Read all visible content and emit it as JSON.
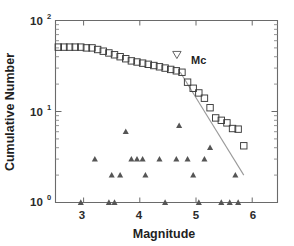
{
  "chart_data": {
    "type": "scatter",
    "title": "",
    "xlabel": "Magnitude",
    "ylabel": "Cumulative Number",
    "xlim": [
      2.5,
      6.45
    ],
    "ylim": [
      1,
      100
    ],
    "yscale": "log",
    "xscale": "linear",
    "grid": false,
    "legend": "none",
    "xticks": [
      3,
      4,
      5,
      6
    ],
    "xtick_labels": [
      "3",
      "4",
      "5",
      "6"
    ],
    "yticks": [
      1,
      10,
      100
    ],
    "ytick_labels": [
      "10",
      "10",
      "10"
    ],
    "ytick_exponents": [
      "0",
      "1",
      "2"
    ],
    "series": [
      {
        "name": "Cumulative number",
        "marker": "open-square",
        "x": [
          2.55,
          2.65,
          2.75,
          2.85,
          2.95,
          3.05,
          3.15,
          3.25,
          3.35,
          3.45,
          3.55,
          3.65,
          3.75,
          3.85,
          3.95,
          4.05,
          4.15,
          4.25,
          4.35,
          4.45,
          4.55,
          4.65,
          4.75,
          4.85,
          4.95,
          5.05,
          5.15,
          5.25,
          5.35,
          5.45,
          5.55,
          5.65,
          5.75,
          5.85
        ],
        "y": [
          51,
          51,
          51,
          51,
          51,
          50,
          50,
          48,
          46,
          44,
          42,
          40,
          38,
          36,
          35,
          34,
          33,
          32,
          31,
          30,
          29,
          28,
          27,
          21,
          18,
          16,
          14,
          11,
          8.5,
          8,
          7.5,
          6.5,
          6.4,
          4.2
        ]
      },
      {
        "name": "Incremental number",
        "marker": "filled-triangle-up",
        "x": [
          2.95,
          3.2,
          3.45,
          3.5,
          3.55,
          3.65,
          3.75,
          3.85,
          3.95,
          4.05,
          4.1,
          4.35,
          4.45,
          4.65,
          4.7,
          4.85,
          4.95,
          5.05,
          5.15,
          5.25,
          5.45,
          5.6,
          5.7,
          5.75
        ],
        "y": [
          1,
          3,
          1,
          2,
          1,
          2,
          6,
          3,
          3,
          3,
          2,
          3,
          1,
          3,
          7,
          3,
          2,
          1,
          3,
          4,
          1,
          1,
          2,
          1
        ]
      }
    ],
    "fit_line": {
      "x0": 4.72,
      "y0": 27,
      "x1": 5.85,
      "y1": 2.0,
      "style": "solid"
    },
    "annotations": [
      {
        "name": "mc-marker",
        "label": "Mc",
        "marker": "open-triangle-down",
        "x": 4.66,
        "y": 42
      }
    ]
  },
  "labels": {
    "mc": "Mc",
    "xlabel": "Magnitude",
    "ylabel": "Cumulative Number",
    "tick_x_1": "3",
    "tick_x_2": "4",
    "tick_x_3": "5",
    "tick_x_4": "6",
    "tick_y_base": "10",
    "tick_y_exp_0": "0",
    "tick_y_exp_1": "1",
    "tick_y_exp_2": "2"
  },
  "colors": {
    "axis": "#6a6a6a",
    "marker_square": "#3a3a3a",
    "marker_triangle": "#555555",
    "fit_line": "#9a9a9a",
    "background": "#ffffff",
    "text": "#1f1f1f"
  }
}
